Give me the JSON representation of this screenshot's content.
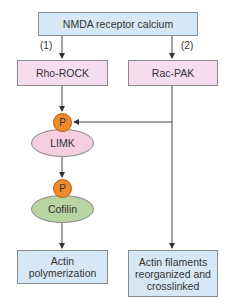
{
  "diagram": {
    "top": {
      "label": "NMDA receptor calcium",
      "color": "#d6e8f5"
    },
    "pathway_labels": [
      "(1)",
      "(2)"
    ],
    "left": {
      "node1": {
        "label": "Rho-ROCK",
        "color": "#f5dcef"
      },
      "phospho": "P",
      "limk": {
        "label": "LIMK",
        "color": "#f5cfe0"
      },
      "cofilin": {
        "label": "Cofilin",
        "color": "#b8d4a0"
      },
      "outcome": {
        "label": "Actin polymerization",
        "color": "#d6e8f5"
      }
    },
    "right": {
      "node1": {
        "label": "Rac-PAK",
        "color": "#f5dcef"
      },
      "outcome": {
        "label": "Actin filaments reorganized and crosslinked",
        "color": "#d6e8f5"
      }
    },
    "phospho_color": "#f08a2a"
  }
}
